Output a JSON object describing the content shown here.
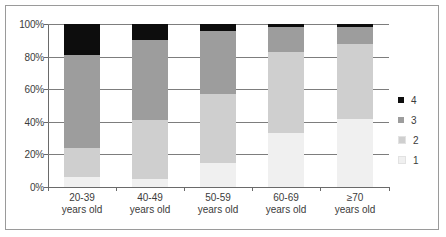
{
  "chart_data": {
    "type": "bar",
    "stacked": true,
    "stack_mode": "percent",
    "title": "",
    "xlabel": "",
    "ylabel": "",
    "ylim": [
      0,
      100
    ],
    "yticks": [
      "0%",
      "20%",
      "40%",
      "60%",
      "80%",
      "100%"
    ],
    "ytick_values": [
      0,
      20,
      40,
      60,
      80,
      100
    ],
    "grid": true,
    "legend_position": "right",
    "categories": [
      "20-39\nyears old",
      "40-49\nyears old",
      "50-59\nyears old",
      "60-69\nyears old",
      "≥70\nyears old"
    ],
    "category_lines": [
      {
        "line1": "20-39",
        "line2": "years old"
      },
      {
        "line1": "40-49",
        "line2": "years old"
      },
      {
        "line1": "50-59",
        "line2": "years old"
      },
      {
        "line1": "60-69",
        "line2": "years old"
      },
      {
        "line1": "≥70",
        "line2": "years old"
      }
    ],
    "series": [
      {
        "name": "1",
        "color": "#f0f0f0",
        "values": [
          6,
          5,
          15,
          33,
          42
        ]
      },
      {
        "name": "2",
        "color": "#cfcfcf",
        "values": [
          18,
          36,
          42,
          50,
          46
        ]
      },
      {
        "name": "3",
        "color": "#9d9d9d",
        "values": [
          57,
          49,
          39,
          15,
          10
        ]
      },
      {
        "name": "4",
        "color": "#0d0d0d",
        "values": [
          19,
          10,
          4,
          2,
          2
        ]
      }
    ],
    "cumulative_tops": [
      {
        "category": "20-39 years old",
        "s1": 6,
        "s2": 24,
        "s3": 81,
        "s4": 100
      },
      {
        "category": "40-49 years old",
        "s1": 5,
        "s2": 41,
        "s3": 90,
        "s4": 100
      },
      {
        "category": "50-59 years old",
        "s1": 15,
        "s2": 57,
        "s3": 96,
        "s4": 100
      },
      {
        "category": "60-69 years old",
        "s1": 33,
        "s2": 83,
        "s3": 98,
        "s4": 100
      },
      {
        "category": "≥70 years old",
        "s1": 42,
        "s2": 88,
        "s3": 98,
        "s4": 100
      }
    ]
  },
  "legend": {
    "items": [
      {
        "label": "4",
        "color": "#0d0d0d"
      },
      {
        "label": "3",
        "color": "#9d9d9d"
      },
      {
        "label": "2",
        "color": "#cfcfcf"
      },
      {
        "label": "1",
        "color": "#f0f0f0"
      }
    ]
  },
  "axis": {
    "y_labels": [
      "100%",
      "80%",
      "60%",
      "40%",
      "20%",
      "0%"
    ]
  }
}
